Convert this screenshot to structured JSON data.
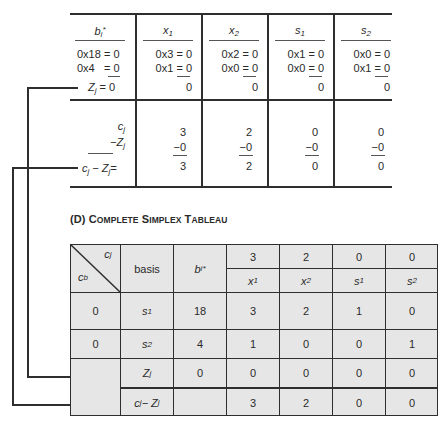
{
  "top_table": {
    "columns": [
      {
        "header": "b",
        "header_sub": "i",
        "header_sup": "*",
        "lines": [
          "0x18 = 0",
          "0x4   = 0"
        ],
        "total": "Z",
        "total_sub": "j",
        "total_eq": "= 0"
      },
      {
        "header": "x",
        "header_sub": "1",
        "lines": [
          "0x3 = 0",
          "0x1 = 0"
        ],
        "total": "0"
      },
      {
        "header": "x",
        "header_sub": "2",
        "lines": [
          "0x2 = 0",
          "0x0 = 0"
        ],
        "total": "0"
      },
      {
        "header": "s",
        "header_sub": "1",
        "lines": [
          "0x1 = 0",
          "0x0 = 0"
        ],
        "total": "0"
      },
      {
        "header": "s",
        "header_sub": "2",
        "lines": [
          "0x0 = 0",
          "0x1 = 0"
        ],
        "total": "0"
      }
    ],
    "lower_labels": {
      "cj": "c",
      "cj_sub": "j",
      "minus_zj": "−Z",
      "minus_zj_sub": "j",
      "cj_minus_zj": "c",
      "cj_minus_zj_mid": " − Z",
      "cj_minus_zj_sub": "j",
      "cj_minus_zj_end": "="
    },
    "lower_values": [
      {
        "cj": "3",
        "zj": "−0",
        "diff": "3"
      },
      {
        "cj": "2",
        "zj": "−0",
        "diff": "2"
      },
      {
        "cj": "0",
        "zj": "−0",
        "diff": "0"
      },
      {
        "cj": "0",
        "zj": "−0",
        "diff": "0"
      }
    ]
  },
  "section_title": {
    "prefix": "(D) ",
    "words": [
      {
        "cap": "C",
        "rest": "OMPLETE"
      },
      {
        "cap": "S",
        "rest": "IMPLEX"
      },
      {
        "cap": "T",
        "rest": "ABLEAU"
      }
    ]
  },
  "tableau": {
    "corner_top": "c",
    "corner_top_sub": "j",
    "corner_bottom": "c",
    "corner_bottom_sub": "b",
    "basis_header": "basis",
    "bi_header": "b",
    "bi_sub": "i",
    "bi_sup": "*",
    "cj_values": [
      "3",
      "2",
      "0",
      "0"
    ],
    "var_headers": [
      {
        "name": "x",
        "sub": "1"
      },
      {
        "name": "x",
        "sub": "2"
      },
      {
        "name": "s",
        "sub": "1"
      },
      {
        "name": "s",
        "sub": "2"
      }
    ],
    "rows": [
      {
        "cb": "0",
        "basis": "s",
        "basis_sub": "1",
        "bi": "18",
        "values": [
          "3",
          "2",
          "1",
          "0"
        ]
      },
      {
        "cb": "0",
        "basis": "s",
        "basis_sub": "2",
        "bi": "4",
        "values": [
          "1",
          "0",
          "0",
          "1"
        ]
      },
      {
        "cb": "",
        "basis": "Z",
        "basis_sub": "j",
        "bi": "0",
        "values": [
          "0",
          "0",
          "0",
          "0"
        ]
      },
      {
        "cb": "",
        "basis": "c",
        "basis_sub": "j",
        "basis_mid": " − Z",
        "basis_sub2": "j",
        "bi": "",
        "values": [
          "3",
          "2",
          "0",
          "0"
        ]
      }
    ]
  },
  "colors": {
    "line": "#2e2e2e",
    "tableau_fill": "#e6e6e6",
    "text": "#2a2a2a"
  }
}
